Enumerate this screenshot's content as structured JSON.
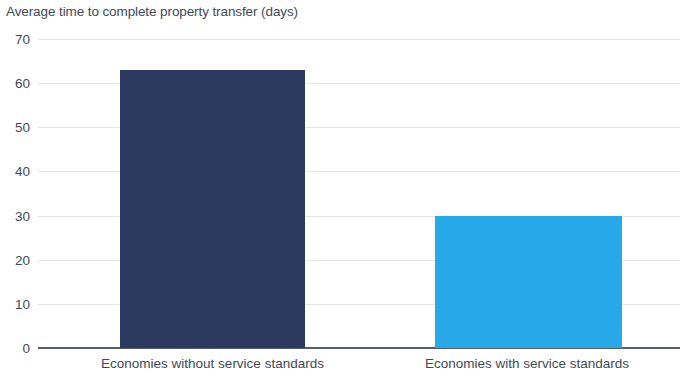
{
  "chart_data": {
    "type": "bar",
    "title": "Average time to complete property transfer (days)",
    "xlabel": "",
    "ylabel": "",
    "categories": [
      "Economies without service standards",
      "Economies with service standards"
    ],
    "values": [
      63,
      30
    ],
    "ylim": [
      0,
      70
    ],
    "ytick_labels": [
      "70",
      "60",
      "50",
      "40",
      "30",
      "20",
      "10",
      "0"
    ],
    "ytick_values": [
      70,
      60,
      50,
      40,
      30,
      20,
      10,
      0
    ],
    "grid": true,
    "legend": "none",
    "bar_colors": [
      "#2b3a5e",
      "#27a8e8"
    ],
    "title_color": "#3f4a57",
    "gridline_color": "#e6e6e6",
    "axis_color": "#585f66",
    "background_color": "#ffffff"
  }
}
